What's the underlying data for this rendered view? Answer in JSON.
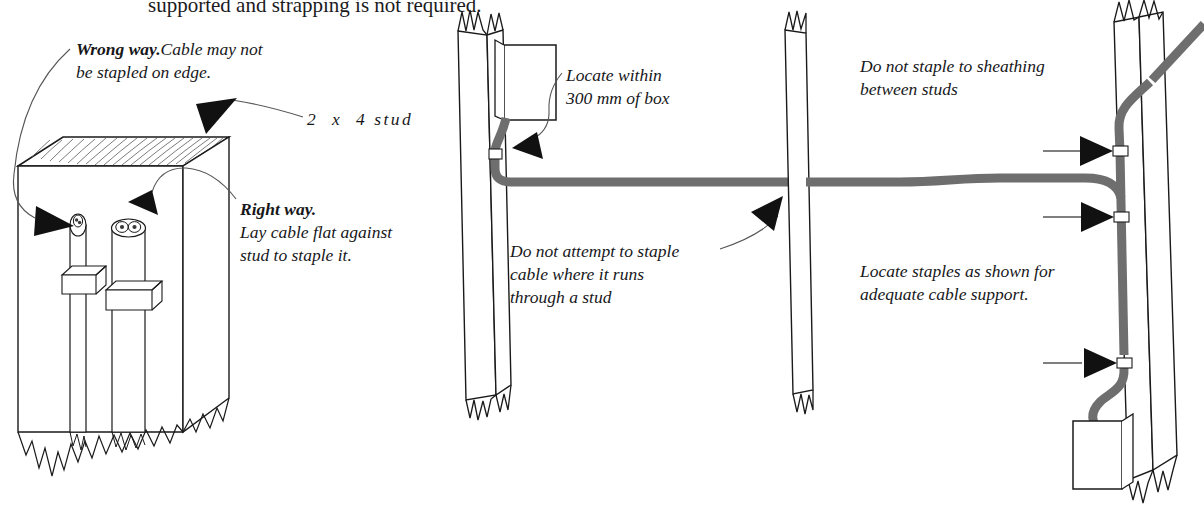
{
  "document": {
    "type": "instructional-illustration",
    "subject": "Stapling non-metallic sheathed cable to wood studs",
    "cut_off_heading": "supported and strapping is not required."
  },
  "annotations": {
    "wrong_way": {
      "emphasis": "Wrong way.",
      "body_line1": "Cable may not",
      "body_line2": "be stapled on edge."
    },
    "stud_label": "2  x  4 stud",
    "right_way": {
      "emphasis": "Right way.",
      "body_line1": "Lay cable flat against",
      "body_line2": "stud to staple it."
    },
    "locate_box": {
      "line1": "Locate within",
      "line2": "300 mm of box"
    },
    "do_not_staple_stud": {
      "line1": "Do not attempt to staple",
      "line2": "cable where it runs",
      "line3": "through a stud"
    },
    "do_not_staple_sheathing": {
      "line1": "Do not staple to sheathing",
      "line2": "between studs"
    },
    "locate_staples": {
      "line1": "Locate staples as shown for",
      "line2": "adequate cable support."
    }
  },
  "colors": {
    "cable": "#6e6e6e",
    "cable_dark": "#5a5a5a",
    "outline": "#1a1a1a",
    "paper": "#ffffff",
    "staple_fill": "#ffffff",
    "arrow": "#111111",
    "leader": "#555555"
  },
  "panels": [
    {
      "name": "left-detail",
      "description": "Perspective 2 x 4 stud with two cable ends stapled to the broad face",
      "cables": [
        {
          "id": "cable-on-edge",
          "orientation": "on-edge",
          "verdict": "wrong"
        },
        {
          "id": "cable-flat",
          "orientation": "flat",
          "verdict": "right"
        }
      ],
      "staples": 2
    },
    {
      "name": "middle-run",
      "description": "Cable leaving a device box, stapled within 300 mm, running horizontally through an intermediate stud",
      "studs": 2,
      "boxes": 1,
      "staples": 1
    },
    {
      "name": "right-run",
      "description": "Vertical cable run stapled to a stud at three points, dropping into a device box",
      "studs": 1,
      "boxes": 1,
      "staples": 3
    }
  ]
}
